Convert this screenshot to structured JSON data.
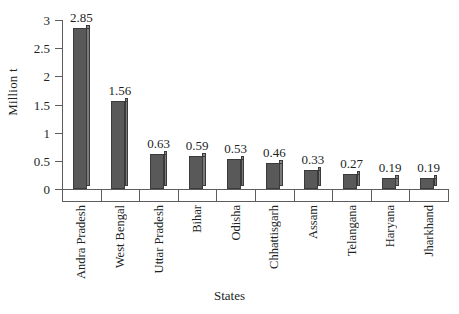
{
  "chart_data": {
    "type": "bar",
    "title": "",
    "xlabel": "States",
    "ylabel": "Million t",
    "categories": [
      "Andra Pradesh",
      "West Bengal",
      "Uttar Pradesh",
      "Bihar",
      "Odisha",
      "Chhattisgarh",
      "Assam",
      "Telangana",
      "Haryana",
      "Jharkhand"
    ],
    "values": [
      2.85,
      1.56,
      0.63,
      0.59,
      0.53,
      0.46,
      0.33,
      0.27,
      0.19,
      0.19
    ],
    "value_labels": [
      "2.85",
      "1.56",
      "0.63",
      "0.59",
      "0.53",
      "0.46",
      "0.33",
      "0.27",
      "0.19",
      "0.19"
    ],
    "ylim": [
      0,
      3
    ],
    "yticks": [
      0,
      0.5,
      1,
      1.5,
      2,
      2.5,
      3
    ],
    "ytick_labels": [
      "0",
      "0.5",
      "1",
      "1.5",
      "2",
      "2.5",
      "3"
    ],
    "grid": false,
    "legend": null,
    "bar_color": "#595959",
    "bar_side_color": "#7a7a7a",
    "bar_edge_color": "#3b3b3b",
    "axis_color": "#5d5d5d",
    "background": "#ffffff"
  }
}
